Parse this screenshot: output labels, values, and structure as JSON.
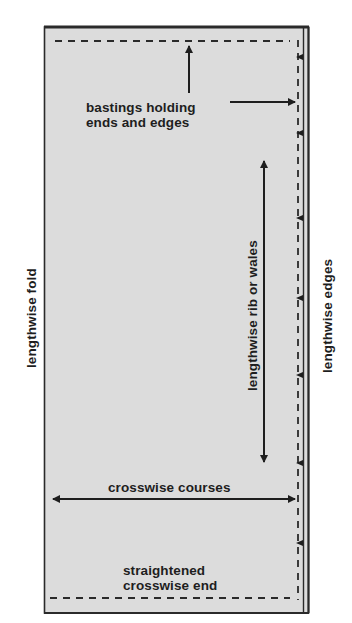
{
  "diagram": {
    "type": "knit fabric preparation diagram",
    "colors": {
      "fabric_fill": "#dcdcdc",
      "ink": "#1e1e1e",
      "background": "#ffffff"
    },
    "labels": {
      "bastings": "bastings holding",
      "bastings_line2": "ends and edges",
      "lengthwise_rib": "lengthwise rib or wales",
      "crosswise_courses": "crosswise courses",
      "straightened_end": "straightened",
      "straightened_end_line2": "crosswise end",
      "lengthwise_fold": "lengthwise fold",
      "lengthwise_edges": "lengthwise edges"
    },
    "elements": {
      "fabric_rect": {
        "x": 44,
        "y": 26,
        "width": 265,
        "height": 587
      },
      "basting_top": {
        "y": 41,
        "x1": 55,
        "x2": 290
      },
      "basting_right": {
        "x": 298,
        "y1": 41,
        "y2": 600
      },
      "basting_bottom": {
        "y": 598,
        "x1": 50,
        "x2": 290
      },
      "edge_ticks_y": [
        57,
        133,
        218,
        298,
        375,
        463,
        543
      ],
      "arrows": [
        {
          "name": "bastings-up-arrow",
          "from": [
            189,
            93
          ],
          "to": [
            189,
            45
          ]
        },
        {
          "name": "bastings-right-arrow",
          "from": [
            230,
            102
          ],
          "to": [
            296,
            102
          ]
        },
        {
          "name": "lengthwise-rib-arrow",
          "from": [
            264,
            160
          ],
          "to": [
            264,
            463
          ],
          "double": true
        },
        {
          "name": "crosswise-courses-arrow",
          "from": [
            52,
            499
          ],
          "to": [
            296,
            499
          ],
          "double": true
        }
      ]
    }
  }
}
